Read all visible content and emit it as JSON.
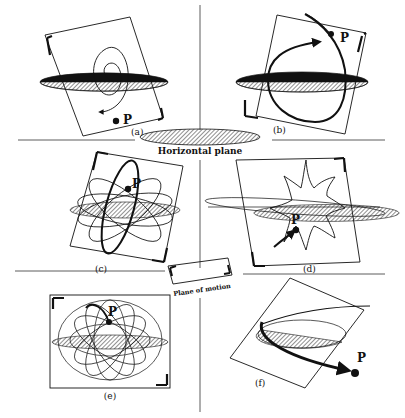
{
  "figure": {
    "captions": {
      "horizontal_plane": "Horizontal plane",
      "plane_of_motion": "Plane of motion"
    },
    "panels": [
      {
        "id": "a",
        "label": "(a)",
        "point": "P",
        "description": "Spiral motion in a tilted plane, spiralling outward to point P"
      },
      {
        "id": "b",
        "label": "(b)",
        "point": "P",
        "description": "Elliptical orbit in tilted plane with arrow toward P"
      },
      {
        "id": "c",
        "label": "(c)",
        "point": "P",
        "description": "Rotating elliptical orbits (rosette) in tilted plane"
      },
      {
        "id": "d",
        "label": "(d)",
        "point": "P",
        "description": "Star-shaped path with arrow leading to P"
      },
      {
        "id": "e",
        "label": "(e)",
        "point": "P",
        "description": "Rosette of many ellipses in a vertical rectangular plane"
      },
      {
        "id": "f",
        "label": "(f)",
        "point": "P",
        "description": "Open hyperbolic-like path escaping to P"
      }
    ],
    "colors": {
      "ink": "#111111",
      "background": "#ffffff"
    }
  }
}
